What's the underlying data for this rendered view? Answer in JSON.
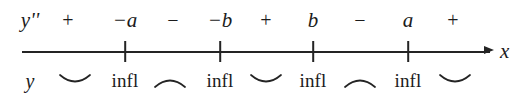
{
  "diagram": {
    "axis": {
      "name": "x",
      "arrow_direction": "right",
      "line_color": "#242424"
    },
    "rows": {
      "top": {
        "label": "y''",
        "items": [
          {
            "kind": "sign",
            "text": "+",
            "x": 68
          },
          {
            "kind": "value",
            "text": "−a",
            "x": 125
          },
          {
            "kind": "sign",
            "text": "−",
            "x": 173
          },
          {
            "kind": "value",
            "text": "−b",
            "x": 220
          },
          {
            "kind": "sign",
            "text": "+",
            "x": 266
          },
          {
            "kind": "value",
            "text": "b",
            "x": 313
          },
          {
            "kind": "sign",
            "text": "−",
            "x": 360
          },
          {
            "kind": "value",
            "text": "a",
            "x": 408
          },
          {
            "kind": "sign",
            "text": "+",
            "x": 453
          }
        ]
      },
      "bottom": {
        "label": "y",
        "items": [
          {
            "kind": "arc",
            "shape": "concave-up",
            "x": 75
          },
          {
            "kind": "infl",
            "text": "infl",
            "x": 125
          },
          {
            "kind": "arc",
            "shape": "concave-down",
            "x": 170
          },
          {
            "kind": "infl",
            "text": "infl",
            "x": 220
          },
          {
            "kind": "arc",
            "shape": "concave-up",
            "x": 266
          },
          {
            "kind": "infl",
            "text": "infl",
            "x": 313
          },
          {
            "kind": "arc",
            "shape": "concave-down",
            "x": 360
          },
          {
            "kind": "infl",
            "text": "infl",
            "x": 408
          },
          {
            "kind": "arc",
            "shape": "concave-up",
            "x": 455
          }
        ]
      }
    },
    "ticks": [
      {
        "label": "−a",
        "x": 125
      },
      {
        "label": "−b",
        "x": 220
      },
      {
        "label": "b",
        "x": 313
      },
      {
        "label": "a",
        "x": 408
      }
    ],
    "labels": {
      "y_double_prime": "y''",
      "y": "y",
      "x_axis": "x",
      "inflection": "infl",
      "plus": "+",
      "minus": "−"
    }
  }
}
